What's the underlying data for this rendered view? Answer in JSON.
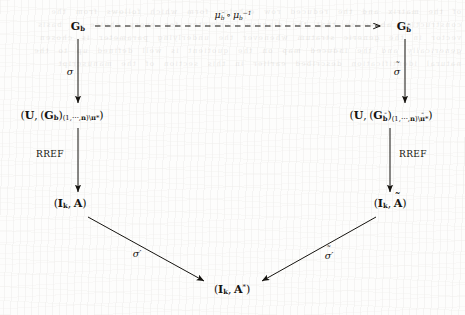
{
  "figure": {
    "kind": "commutative-diagram",
    "nodes": [
      {
        "id": "top-left",
        "label": "G_b",
        "x": 78,
        "y": 27
      },
      {
        "id": "top-right",
        "label": "G_b-tilde",
        "x": 404,
        "y": 27
      },
      {
        "id": "mid-left",
        "label": "(U,(G_b)_{(1,...,n)\\pi*})",
        "x": 60,
        "y": 116
      },
      {
        "id": "mid-right",
        "label": "(U,(G_b-tilde)_{(1,...,n)\\pi-tilde*})",
        "x": 392,
        "y": 116
      },
      {
        "id": "bottom-left",
        "label": "(I_k, A)",
        "x": 70,
        "y": 204
      },
      {
        "id": "bottom-right",
        "label": "(I_k, A-tilde)",
        "x": 390,
        "y": 204
      },
      {
        "id": "center-bottom",
        "label": "(I_k, A*)",
        "x": 232,
        "y": 290
      }
    ],
    "edges": [
      {
        "id": "top-horizontal",
        "from": "top-left",
        "to": "top-right",
        "style": "dashed",
        "label": "mu_b-tilde o mu_b^-1",
        "label_x": 233,
        "label_y": 16
      },
      {
        "id": "left-vertical-1",
        "from": "top-left",
        "to": "mid-left",
        "style": "solid",
        "label": "sigma",
        "label_x": 77,
        "label_y": 72
      },
      {
        "id": "right-vertical-1",
        "from": "top-right",
        "to": "mid-right",
        "style": "solid",
        "label": "sigma-tilde",
        "label_x": 396,
        "label_y": 72
      },
      {
        "id": "left-vertical-2",
        "from": "mid-left",
        "to": "bottom-left",
        "style": "solid",
        "label": "RREF",
        "label_x": 50,
        "label_y": 154
      },
      {
        "id": "right-vertical-2",
        "from": "mid-right",
        "to": "bottom-right",
        "style": "solid",
        "label": "RREF",
        "label_x": 413,
        "label_y": 154
      },
      {
        "id": "left-diagonal",
        "from": "bottom-left",
        "to": "center-bottom",
        "style": "solid",
        "label": "sigma-prime",
        "label_x": 137,
        "label_y": 254
      },
      {
        "id": "right-diagonal",
        "from": "bottom-right",
        "to": "center-bottom",
        "style": "solid",
        "label": "sigma-tilde-prime",
        "label_x": 328,
        "label_y": 256
      }
    ],
    "text": {
      "G": "G",
      "U": "U",
      "I": "I",
      "A": "A",
      "A_star": "A*",
      "b": "b",
      "k": "k",
      "n": "n",
      "pi_star": "\\π*",
      "index_range": "(1, ⋯ , n)",
      "rref": "RREF",
      "mu": "μ",
      "sigma": "σ",
      "circ": "∘",
      "inverse": "−1",
      "prime": "′",
      "comma": ",",
      "lparen": "(",
      "rparen": ")",
      "backslash": "\\"
    },
    "colors": {
      "ink": "#15130f",
      "paper": "#fdfdfc",
      "bleed": "#4a4036"
    }
  },
  "background": {
    "ghost_text": "of the matrix and the reduced row echelon form which follows from the construction above so that the diagram commutes for every choice of basis vector in the generic stratum whenever the underlying parameter is chosen generically and the induced map on the quotient is well defined up to the natural identification described earlier in this section of the manuscript"
  }
}
